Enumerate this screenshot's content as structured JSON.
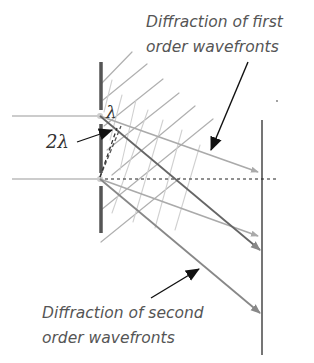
{
  "diagram": {
    "labels": {
      "first_order_line1": "Diffraction of first",
      "first_order_line2": "order wavefronts",
      "second_order_line1": "Diffraction of second",
      "second_order_line2": "order wavefronts",
      "path_difference_2": "2λ",
      "path_difference_1": "λ"
    },
    "colors": {
      "barrier": "#555555",
      "screen": "#666666",
      "beam": "#bbbbbb",
      "wavefront": "#aaaaaa",
      "wavefront_light": "#cccccc",
      "first_order_ray": "#aaaaaa",
      "second_order_ray": "#888888",
      "pointer": "#222222",
      "text": "#555555"
    },
    "elements": {
      "slits": [
        "upper-slit",
        "lower-slit"
      ],
      "rays": [
        "first-order-upper",
        "first-order-lower",
        "second-order-upper",
        "second-order-lower"
      ]
    }
  }
}
